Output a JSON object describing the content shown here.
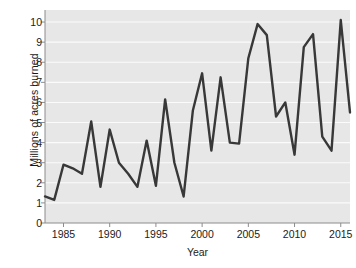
{
  "chart_data": {
    "type": "line",
    "title": "",
    "xlabel": "Year",
    "ylabel": "Millions of acres burned",
    "xlim": [
      1983,
      2016
    ],
    "ylim": [
      0,
      10.6
    ],
    "grid": true,
    "legend": "none",
    "y_ticks": [
      0,
      1,
      2,
      3,
      4,
      5,
      6,
      7,
      8,
      9,
      10
    ],
    "x_ticks": [
      1985,
      1990,
      1995,
      2000,
      2005,
      2010,
      2015
    ],
    "x": [
      1983,
      1984,
      1985,
      1986,
      1987,
      1988,
      1989,
      1990,
      1991,
      1992,
      1993,
      1994,
      1995,
      1996,
      1997,
      1998,
      1999,
      2000,
      2001,
      2002,
      2003,
      2004,
      2005,
      2006,
      2007,
      2008,
      2009,
      2010,
      2011,
      2012,
      2013,
      2014,
      2015,
      2016
    ],
    "values": [
      1.32,
      1.15,
      2.9,
      2.72,
      2.45,
      5.05,
      1.8,
      4.65,
      3.0,
      2.45,
      1.8,
      4.1,
      1.85,
      6.15,
      3.0,
      1.32,
      5.6,
      7.45,
      3.6,
      7.25,
      4.0,
      3.95,
      8.2,
      9.9,
      9.35,
      5.3,
      6.0,
      3.4,
      8.75,
      9.4,
      4.3,
      3.6,
      10.1,
      5.5
    ],
    "series_name": "Acres burned",
    "colors": {
      "line": "#383838",
      "panel": "#e7e7e7",
      "gridline": "#fbfbfb",
      "axis": "#8c8c8c",
      "text": "#1b1b1b"
    }
  },
  "axes": {
    "y_tick_labels": [
      "10",
      "9",
      "8",
      "7",
      "6",
      "5",
      "4",
      "3",
      "2",
      "1",
      "0"
    ],
    "x_tick_labels": [
      "1985",
      "1990",
      "1995",
      "2000",
      "2005",
      "2010",
      "2015"
    ],
    "y_title": "Millions of acres burned",
    "x_title": "Year"
  }
}
